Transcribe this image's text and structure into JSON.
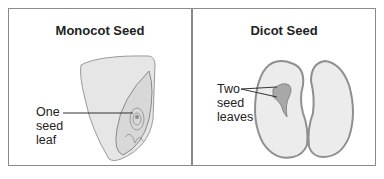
{
  "panels": [
    {
      "title": "Monocot Seed",
      "label_lines": [
        "One",
        "seed",
        "leaf"
      ]
    },
    {
      "title": "Dicot Seed",
      "label_lines": [
        "Two",
        "seed",
        "leaves"
      ]
    }
  ]
}
